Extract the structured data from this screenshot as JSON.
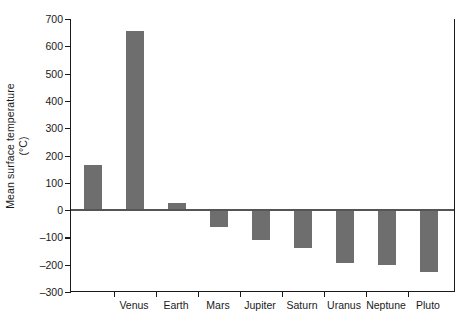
{
  "chart_data": {
    "type": "bar",
    "title": "",
    "subtitle": "",
    "xlabel": "",
    "ylabel": "Mean surface temperature (°C)",
    "ylabel_line1": "Mean surface temperature",
    "ylabel_line2": "(°C)",
    "categories": [
      "",
      "Venus",
      "Earth",
      "Mars",
      "Jupiter",
      "Saturn",
      "Uranus",
      "Neptune",
      "Pluto"
    ],
    "values": [
      167,
      657,
      25,
      -63,
      -110,
      -140,
      -195,
      -200,
      -225
    ],
    "bar_color": "#6e6e6e",
    "ylim": [
      -300,
      700
    ],
    "ytick_values": [
      700,
      600,
      500,
      400,
      300,
      200,
      100,
      0,
      -100,
      -200,
      -300
    ],
    "ytick_labels": [
      "700",
      "600",
      "500",
      "400",
      "300",
      "200",
      "100",
      "0",
      "–100",
      "–200",
      "–300"
    ],
    "grid": false,
    "legend": null,
    "zero_line": true,
    "axis_frame": "left-bottom-right",
    "note": "Nine bars are drawn; the leftmost bar (Mercury) has no visible category label in the image."
  },
  "figure": {
    "background": "#ffffff",
    "axis_color": "#1a1a1a"
  }
}
